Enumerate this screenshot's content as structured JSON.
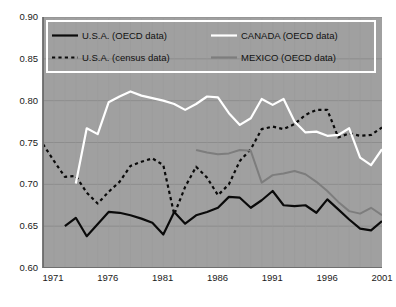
{
  "chart_data": {
    "type": "line",
    "title": "",
    "xlabel": "",
    "ylabel": "",
    "xlim": [
      1970,
      2001
    ],
    "ylim": [
      0.6,
      0.9
    ],
    "grid": true,
    "legend_position": "top-inside",
    "background_color": "#a0a0a0",
    "xticks": [
      1971,
      1976,
      1981,
      1986,
      1991,
      1996,
      2001
    ],
    "yticks": [
      "0.60",
      "0.65",
      "0.70",
      "0.75",
      "0.80",
      "0.85",
      "0.90"
    ],
    "series": [
      {
        "name": "U.S.A. (OECD data)",
        "color": "#0a0a0a",
        "style": "solid",
        "width": 2.2,
        "x": [
          1972,
          1973,
          1974,
          1976,
          1977,
          1978,
          1979,
          1980,
          1981,
          1982,
          1983,
          1984,
          1985,
          1986,
          1987,
          1988,
          1989,
          1990,
          1991,
          1992,
          1993,
          1994,
          1995,
          1996,
          1997,
          1998,
          1999,
          2000,
          2001
        ],
        "values": [
          0.65,
          0.66,
          0.638,
          0.667,
          0.666,
          0.663,
          0.659,
          0.654,
          0.64,
          0.667,
          0.653,
          0.663,
          0.667,
          0.672,
          0.685,
          0.684,
          0.672,
          0.681,
          0.692,
          0.675,
          0.674,
          0.675,
          0.666,
          0.682,
          0.67,
          0.658,
          0.647,
          0.645,
          0.656
        ]
      },
      {
        "name": "U.S.A. (census data)",
        "color": "#0a0a0a",
        "style": "dashed",
        "width": 2.2,
        "x": [
          1970,
          1971,
          1972,
          1973,
          1974,
          1975,
          1976,
          1977,
          1978,
          1979,
          1980,
          1981,
          1982,
          1983,
          1984,
          1985,
          1986,
          1987,
          1988,
          1989,
          1990,
          1991,
          1992,
          1993,
          1994,
          1995,
          1996,
          1997,
          1998,
          1999,
          2000,
          2001
        ],
        "values": [
          0.748,
          0.728,
          0.709,
          0.71,
          0.69,
          0.677,
          0.691,
          0.703,
          0.722,
          0.727,
          0.731,
          0.723,
          0.664,
          0.697,
          0.721,
          0.708,
          0.687,
          0.7,
          0.728,
          0.742,
          0.766,
          0.769,
          0.766,
          0.772,
          0.783,
          0.789,
          0.789,
          0.756,
          0.761,
          0.758,
          0.759,
          0.768
        ]
      },
      {
        "name": "CANADA (OECD data)",
        "color": "#ffffff",
        "style": "solid",
        "width": 2.2,
        "x": [
          1973,
          1974,
          1975,
          1976,
          1977,
          1978,
          1979,
          1980,
          1981,
          1982,
          1983,
          1984,
          1985,
          1986,
          1987,
          1988,
          1989,
          1990,
          1991,
          1992,
          1993,
          1994,
          1995,
          1996,
          1997,
          1998,
          1999,
          2000,
          2001
        ],
        "values": [
          0.701,
          0.767,
          0.76,
          0.798,
          0.805,
          0.811,
          0.806,
          0.803,
          0.8,
          0.796,
          0.789,
          0.796,
          0.805,
          0.804,
          0.785,
          0.771,
          0.779,
          0.802,
          0.795,
          0.802,
          0.775,
          0.762,
          0.763,
          0.758,
          0.759,
          0.767,
          0.732,
          0.723,
          0.742
        ]
      },
      {
        "name": "MEXICO (OECD data)",
        "color": "#7d7d7d",
        "style": "solid",
        "width": 2.0,
        "x": [
          1984,
          1985,
          1986,
          1987,
          1988,
          1989,
          1990,
          1991,
          1992,
          1993,
          1994,
          1995,
          1996,
          1997,
          1998,
          1999,
          2000,
          2001
        ],
        "values": [
          0.741,
          0.738,
          0.736,
          0.737,
          0.741,
          0.74,
          0.702,
          0.711,
          0.713,
          0.716,
          0.712,
          0.703,
          0.692,
          0.679,
          0.668,
          0.665,
          0.672,
          0.663
        ]
      }
    ]
  },
  "legend": {
    "items": [
      {
        "label": "U.S.A. (OECD data)",
        "color": "#0a0a0a",
        "style": "solid",
        "key": "legend-key-usa-oecd"
      },
      {
        "label": "CANADA (OECD data)",
        "color": "#ffffff",
        "style": "solid",
        "key": "legend-key-canada-oecd"
      },
      {
        "label": "U.S.A. (census data)",
        "color": "#0a0a0a",
        "style": "dashed",
        "key": "legend-key-usa-census"
      },
      {
        "label": "MEXICO (OECD data)",
        "color": "#7d7d7d",
        "style": "solid",
        "key": "legend-key-mexico-oecd"
      }
    ]
  }
}
